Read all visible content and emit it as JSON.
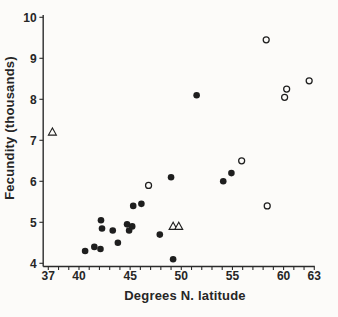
{
  "figure": {
    "background": "#fcfbf9",
    "ink": "#1e1e1e",
    "axis_color": "#2b2b2b"
  },
  "chart_data": {
    "type": "scatter",
    "title": "",
    "xlabel": "Degrees N. latitude",
    "ylabel": "Fecundity (thousands)",
    "xlim": [
      36.5,
      63
    ],
    "ylim": [
      4,
      10
    ],
    "x_major_ticks": [
      37,
      40,
      45,
      50,
      55,
      60,
      63
    ],
    "x_minor_tick_step": 1,
    "y_ticks": [
      4,
      5,
      6,
      7,
      8,
      9,
      10
    ],
    "grid": false,
    "legend": "none",
    "series": [
      {
        "name": "filled-circles",
        "marker": "filled-circle",
        "points": [
          [
            40.6,
            4.3
          ],
          [
            41.5,
            4.4
          ],
          [
            42.1,
            4.35
          ],
          [
            42.15,
            5.05
          ],
          [
            42.25,
            4.85
          ],
          [
            43.3,
            4.8
          ],
          [
            43.8,
            4.5
          ],
          [
            44.7,
            4.95
          ],
          [
            44.9,
            4.8
          ],
          [
            45.2,
            4.9
          ],
          [
            45.3,
            5.4
          ],
          [
            46.1,
            5.45
          ],
          [
            47.9,
            4.7
          ],
          [
            49.0,
            6.1
          ],
          [
            49.2,
            4.1
          ],
          [
            51.5,
            8.1
          ],
          [
            54.1,
            6.0
          ],
          [
            54.9,
            6.2
          ]
        ]
      },
      {
        "name": "open-circles",
        "marker": "open-circle",
        "points": [
          [
            46.8,
            5.9
          ],
          [
            55.9,
            6.5
          ],
          [
            58.3,
            9.45
          ],
          [
            58.4,
            5.4
          ],
          [
            60.1,
            8.05
          ],
          [
            60.3,
            8.25
          ],
          [
            62.5,
            8.45
          ]
        ]
      },
      {
        "name": "open-triangles",
        "marker": "open-triangle",
        "points": [
          [
            37.4,
            7.2
          ],
          [
            49.2,
            4.9
          ],
          [
            49.75,
            4.9
          ]
        ]
      }
    ]
  }
}
